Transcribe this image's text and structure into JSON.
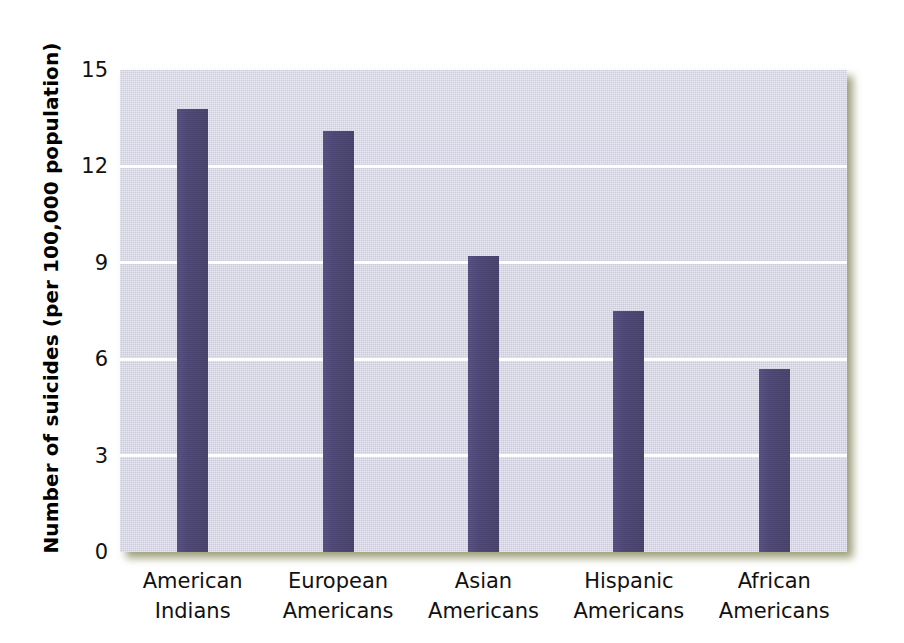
{
  "chart_data": {
    "type": "bar",
    "title": "",
    "xlabel": "",
    "ylabel": "Number of suicides (per 100,000 population)",
    "ylim": [
      0,
      15
    ],
    "yticks": [
      0,
      3,
      6,
      9,
      12,
      15
    ],
    "ytick_labels": [
      "0",
      "3",
      "6",
      "9",
      "12",
      "15"
    ],
    "grid": "horizontal",
    "legend": "none",
    "bar_color": "#4a4472",
    "plot_background": "#cacadd",
    "categories": [
      "American Indians",
      "European Americans",
      "Asian Americans",
      "Hispanic Americans",
      "African Americans"
    ],
    "category_lines": [
      [
        "American",
        "Indians"
      ],
      [
        "European",
        "Americans"
      ],
      [
        "Asian",
        "Americans"
      ],
      [
        "Hispanic",
        "Americans"
      ],
      [
        "African",
        "Americans"
      ]
    ],
    "values": [
      13.8,
      13.1,
      9.2,
      7.5,
      5.7
    ]
  }
}
